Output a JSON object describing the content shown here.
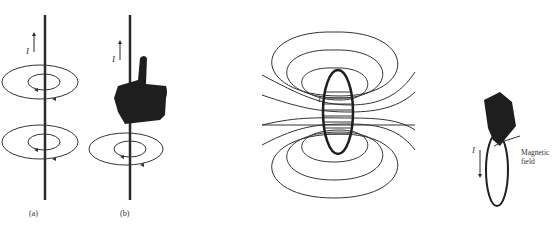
{
  "figure": {
    "panel_a": {
      "caption": "(a)",
      "current_label": "I"
    },
    "panel_b": {
      "caption": "(b)",
      "current_label": "I"
    },
    "panel_c": {
      "current_label": "I"
    },
    "panel_d": {
      "current_label": "I",
      "field_label_line1": "Magnetic",
      "field_label_line2": "field"
    }
  },
  "colors": {
    "ink": "#2a2a2a",
    "hand": "#1e1e1e",
    "background": "#ffffff"
  }
}
